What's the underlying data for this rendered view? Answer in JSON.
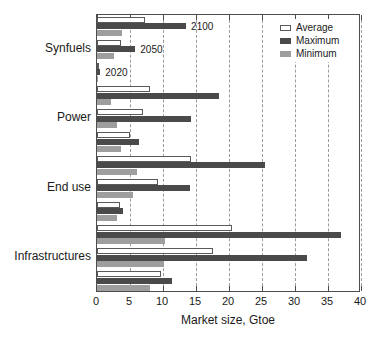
{
  "chart_data": {
    "type": "bar",
    "orientation": "horizontal",
    "title": "",
    "xlabel": "Market size, Gtoe",
    "ylabel": "",
    "xlim": [
      0,
      40
    ],
    "xticks": [
      0,
      5,
      10,
      15,
      20,
      25,
      30,
      35,
      40
    ],
    "grid": true,
    "grid_axis": "x",
    "grid_style": "dashed",
    "legend_position": "top-right",
    "categories": [
      "Synfuels",
      "Power",
      "End use",
      "Infrastructures"
    ],
    "year_blocks": [
      "2100",
      "2050",
      "2020"
    ],
    "annotations": [
      "2100",
      "2050",
      "2020"
    ],
    "series": [
      {
        "name": "Average",
        "color": "#ffffff",
        "edge": "#5a5a5a"
      },
      {
        "name": "Maximum",
        "color": "#4a4a4a",
        "edge": "#4a4a4a"
      },
      {
        "name": "Minimum",
        "color": "#9e9e9e",
        "edge": "#9e9e9e"
      }
    ],
    "groups": [
      {
        "category": "Synfuels",
        "blocks": [
          {
            "year": "2100",
            "Average": 7.3,
            "Maximum": 13.5,
            "Minimum": 3.8
          },
          {
            "year": "2050",
            "Average": 3.6,
            "Maximum": 5.8,
            "Minimum": 2.6
          },
          {
            "year": "2020",
            "Average": 0.3,
            "Maximum": 0.5,
            "Minimum": 0.2
          }
        ]
      },
      {
        "category": "Power",
        "blocks": [
          {
            "year": "2100",
            "Average": 8.1,
            "Maximum": 18.5,
            "Minimum": 2.1
          },
          {
            "year": "2050",
            "Average": 7.0,
            "Maximum": 14.3,
            "Minimum": 3.0
          },
          {
            "year": "2020",
            "Average": 5.0,
            "Maximum": 6.4,
            "Minimum": 3.7
          }
        ]
      },
      {
        "category": "End use",
        "blocks": [
          {
            "year": "2100",
            "Average": 14.2,
            "Maximum": 25.5,
            "Minimum": 6.0
          },
          {
            "year": "2050",
            "Average": 9.3,
            "Maximum": 14.1,
            "Minimum": 5.4
          },
          {
            "year": "2020",
            "Average": 3.5,
            "Maximum": 4.0,
            "Minimum": 3.0
          }
        ]
      },
      {
        "category": "Infrastructures",
        "blocks": [
          {
            "year": "2100",
            "Average": 20.4,
            "Maximum": 37.0,
            "Minimum": 10.3
          },
          {
            "year": "2050",
            "Average": 17.5,
            "Maximum": 31.8,
            "Minimum": 10.2
          },
          {
            "year": "2020",
            "Average": 9.7,
            "Maximum": 11.3,
            "Minimum": 8.0
          }
        ]
      }
    ]
  },
  "axis": {
    "x_tick_labels": [
      "0",
      "5",
      "10",
      "15",
      "20",
      "25",
      "30",
      "35",
      "40"
    ],
    "x_title": "Market size, Gtoe",
    "y_tick_labels": [
      "Synfuels",
      "Power",
      "End use",
      "Infrastructures"
    ]
  },
  "legend": {
    "items": [
      {
        "label": "Average"
      },
      {
        "label": "Maximum"
      },
      {
        "label": "Minimum"
      }
    ]
  },
  "year_labels": [
    {
      "text": "2100"
    },
    {
      "text": "2050"
    },
    {
      "text": "2020"
    }
  ]
}
